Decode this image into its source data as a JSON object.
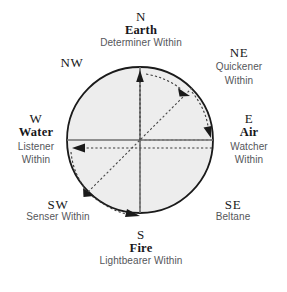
{
  "diagram": {
    "circle": {
      "fill": "#eeeeee",
      "stroke": "#1a1a1a",
      "cx": 140,
      "cy": 140,
      "r": 73
    },
    "axis_color": "#707070",
    "arrow_color": "#1a1a1a",
    "label_color": "#17171a",
    "subtext_color": "#55565a",
    "directions": [
      {
        "id": "n",
        "cardinal": "N",
        "element": "Earth",
        "within": "Determiner Within",
        "within_lines": [
          "Determiner Within"
        ]
      },
      {
        "id": "ne",
        "cardinal": "NE",
        "element": "",
        "within": "Quickener Within",
        "within_lines": [
          "Quickener",
          "Within"
        ]
      },
      {
        "id": "e",
        "cardinal": "E",
        "element": "Air",
        "within": "Watcher Within",
        "within_lines": [
          "Watcher",
          "Within"
        ]
      },
      {
        "id": "se",
        "cardinal": "SE",
        "element": "",
        "within": "Beltane",
        "within_lines": [
          "Beltane"
        ]
      },
      {
        "id": "s",
        "cardinal": "S",
        "element": "Fire",
        "within": "Lightbearer Within",
        "within_lines": [
          "Lightbearer Within"
        ]
      },
      {
        "id": "sw",
        "cardinal": "SW",
        "element": "",
        "within": "Senser Within",
        "within_lines": [
          "Senser Within"
        ]
      },
      {
        "id": "w",
        "cardinal": "W",
        "element": "Water",
        "within": "Listener Within",
        "within_lines": [
          "Listener",
          "Within"
        ]
      },
      {
        "id": "nw",
        "cardinal": "NW",
        "element": "",
        "within": "",
        "within_lines": []
      }
    ]
  }
}
